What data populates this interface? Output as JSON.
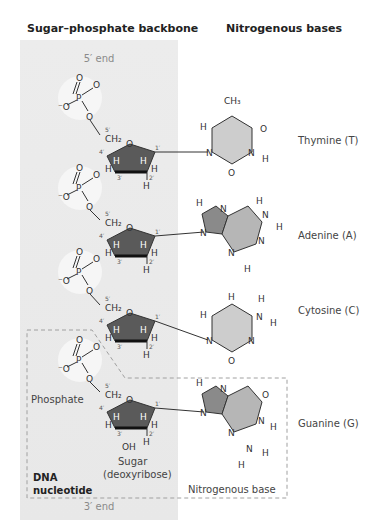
{
  "headers": {
    "backbone": "Sugar–phosphate backbone",
    "bases": "Nitrogenous bases"
  },
  "ends": {
    "top": "5′ end",
    "bottom": "3′ end"
  },
  "bases": [
    {
      "name": "Thymine (T)",
      "type": "pyrimidine"
    },
    {
      "name": "Adenine (A)",
      "type": "purine"
    },
    {
      "name": "Cytosine (C)",
      "type": "pyrimidine"
    },
    {
      "name": "Guanine (G)",
      "type": "purine"
    }
  ],
  "nucleotide_labels": {
    "phosphate": "Phosphate",
    "sugar": "Sugar",
    "sugar_sub": "(deoxyribose)",
    "base": "Nitrogenous base",
    "nucleotide_line1": "DNA",
    "nucleotide_line2": "nucleotide"
  },
  "colors": {
    "backbone_bg": "#e9e9e9",
    "sugar_ring": "#5a5a5a",
    "base_fill": "#c8c8c8",
    "phosphate_circle": "#f4f4f4",
    "dashed_box": "#a0a0a0"
  }
}
